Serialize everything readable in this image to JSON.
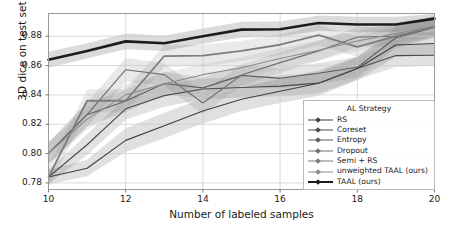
{
  "chart_data": {
    "type": "line",
    "title": "",
    "xlabel": "Number of labeled samples",
    "ylabel": "3D dice on test set",
    "xlim": [
      10,
      20
    ],
    "ylim": [
      0.7755,
      0.8955
    ],
    "xticks": [
      10,
      12,
      14,
      16,
      18,
      20
    ],
    "yticks": [
      0.78,
      0.8,
      0.82,
      0.84,
      0.86,
      0.88
    ],
    "ytick_labels": [
      "0.78",
      "0.80",
      "0.82",
      "0.84",
      "0.86",
      "0.88"
    ],
    "xtick_labels": [
      "10",
      "12",
      "14",
      "16",
      "18",
      "20"
    ],
    "grid": true,
    "legend_position": "lower right",
    "legend_title": "AL Strategy",
    "x": [
      10,
      11,
      12,
      13,
      14,
      15,
      16,
      17,
      18,
      19,
      20
    ],
    "series": [
      {
        "name": "RS",
        "color": "#3f3f3f",
        "width": 1.1,
        "marker": "diamond",
        "values": [
          0.784,
          0.79,
          0.809,
          0.819,
          0.829,
          0.837,
          0.8425,
          0.848,
          0.858,
          0.874,
          0.875
        ],
        "band_low": [
          0.779,
          0.7845,
          0.801,
          0.8105,
          0.8205,
          0.829,
          0.8345,
          0.8395,
          0.85,
          0.866,
          0.8672
        ],
        "band_high": [
          0.789,
          0.7958,
          0.8172,
          0.8278,
          0.8378,
          0.8452,
          0.8508,
          0.8568,
          0.8662,
          0.882,
          0.883
        ]
      },
      {
        "name": "Coreset",
        "color": "#4b4b4b",
        "width": 1.1,
        "marker": "diamond",
        "values": [
          0.784,
          0.806,
          0.8305,
          0.8395,
          0.844,
          0.845,
          0.846,
          0.848,
          0.858,
          0.8668,
          0.867
        ],
        "band_low": [
          0.7795,
          0.799,
          0.823,
          0.832,
          0.837,
          0.8382,
          0.8392,
          0.841,
          0.8505,
          0.859,
          0.8598
        ],
        "band_high": [
          0.7888,
          0.8132,
          0.8382,
          0.8472,
          0.8512,
          0.852,
          0.853,
          0.8552,
          0.8656,
          0.8748,
          0.8746
        ]
      },
      {
        "name": "Entropy",
        "color": "#5d5d5d",
        "width": 1.1,
        "marker": "diamond",
        "values": [
          0.8002,
          0.8265,
          0.8358,
          0.8478,
          0.8448,
          0.8533,
          0.8513,
          0.8548,
          0.8588,
          0.879,
          0.886
        ],
        "band_low": [
          0.793,
          0.8185,
          0.8282,
          0.8402,
          0.838,
          0.8462,
          0.8446,
          0.8478,
          0.8518,
          0.8718,
          0.8792
        ],
        "band_high": [
          0.8075,
          0.8345,
          0.8434,
          0.8556,
          0.8518,
          0.8606,
          0.8582,
          0.8618,
          0.8658,
          0.8862,
          0.8928
        ]
      },
      {
        "name": "Dropout",
        "color": "#6e6e6e",
        "width": 1.1,
        "marker": "diamond",
        "values": [
          0.8002,
          0.8265,
          0.8572,
          0.8538,
          0.8345,
          0.8535,
          0.862,
          0.87,
          0.8795,
          0.88,
          0.8865
        ],
        "band_low": [
          0.7928,
          0.8182,
          0.8492,
          0.846,
          0.827,
          0.8462,
          0.855,
          0.8632,
          0.8728,
          0.8732,
          0.8796
        ],
        "band_high": [
          0.8076,
          0.8348,
          0.8652,
          0.8616,
          0.842,
          0.8608,
          0.869,
          0.8768,
          0.8862,
          0.8868,
          0.8934
        ]
      },
      {
        "name": "Semi + RS",
        "color": "#7d7d7d",
        "width": 1.8,
        "marker": "diamond",
        "values": [
          0.784,
          0.836,
          0.836,
          0.8665,
          0.8668,
          0.87,
          0.8742,
          0.8808,
          0.8728,
          0.88,
          0.8865
        ],
        "band_low": [
          0.7768,
          0.8282,
          0.8282,
          0.8592,
          0.8596,
          0.863,
          0.8672,
          0.874,
          0.8658,
          0.8732,
          0.8798
        ],
        "band_high": [
          0.7912,
          0.8438,
          0.8438,
          0.8738,
          0.874,
          0.877,
          0.8812,
          0.8876,
          0.8798,
          0.8868,
          0.8932
        ]
      },
      {
        "name": "unweighted TAAL (ours)",
        "color": "#8c8c8c",
        "width": 1.1,
        "marker": "diamond",
        "values": [
          0.8002,
          0.8235,
          0.84,
          0.8475,
          0.8538,
          0.8585,
          0.8648,
          0.8705,
          0.8768,
          0.8818,
          0.8872
        ],
        "band_low": [
          0.793,
          0.816,
          0.8325,
          0.84,
          0.8466,
          0.8514,
          0.8578,
          0.8636,
          0.87,
          0.875,
          0.8804
        ],
        "band_high": [
          0.8074,
          0.831,
          0.8475,
          0.855,
          0.861,
          0.8656,
          0.8718,
          0.8774,
          0.8836,
          0.8886,
          0.894
        ]
      },
      {
        "name": "TAAL (ours)",
        "color": "#1c1c1c",
        "width": 2.6,
        "marker": "diamond",
        "values": [
          0.864,
          0.87,
          0.8765,
          0.8752,
          0.88,
          0.8845,
          0.8848,
          0.889,
          0.888,
          0.888,
          0.892
        ],
        "band_low": [
          0.8585,
          0.8648,
          0.8712,
          0.87,
          0.8748,
          0.8792,
          0.8796,
          0.8838,
          0.8828,
          0.8828,
          0.8868
        ],
        "band_high": [
          0.8695,
          0.8752,
          0.8818,
          0.8804,
          0.8852,
          0.8898,
          0.89,
          0.8942,
          0.8932,
          0.8932,
          0.8952
        ]
      }
    ]
  },
  "axes": {
    "ylabel": "3D dice on test set",
    "xlabel": "Number of labeled samples"
  },
  "legend": {
    "title": "AL Strategy",
    "entries": [
      {
        "label": "RS"
      },
      {
        "label": "Coreset"
      },
      {
        "label": "Entropy"
      },
      {
        "label": "Dropout"
      },
      {
        "label": "Semi + RS"
      },
      {
        "label": "unweighted TAAL (ours)"
      },
      {
        "label": "TAAL (ours)"
      }
    ]
  }
}
